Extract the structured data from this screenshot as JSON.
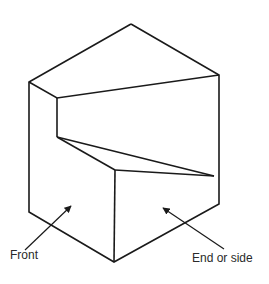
{
  "diagram": {
    "type": "isometric block with notch",
    "stroke_color": "#1a1a1a",
    "labels": {
      "front": "Front",
      "end_or_side": "End or side"
    }
  }
}
